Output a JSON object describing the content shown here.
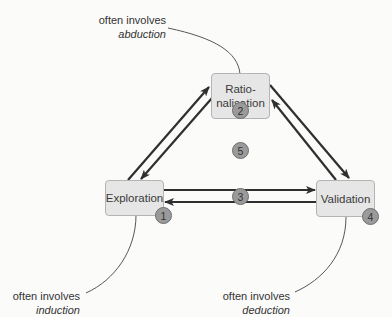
{
  "diagram": {
    "nodes": [
      {
        "id": "rationalisation",
        "label": "Ratio-\nnalisation",
        "badge": "2"
      },
      {
        "id": "exploration",
        "label": "Exploration",
        "badge": "1"
      },
      {
        "id": "validation",
        "label": "Validation",
        "badge": "4"
      }
    ],
    "center_badges": {
      "horizontal_link": "3",
      "center": "5"
    },
    "annotations": {
      "abduction": {
        "line1": "often involves",
        "line2": "abduction"
      },
      "induction": {
        "line1": "often involves",
        "line2": "induction"
      },
      "deduction": {
        "line1": "often involves",
        "line2": "deduction"
      }
    },
    "edges": [
      {
        "from": "exploration",
        "to": "rationalisation"
      },
      {
        "from": "rationalisation",
        "to": "exploration"
      },
      {
        "from": "rationalisation",
        "to": "validation"
      },
      {
        "from": "validation",
        "to": "rationalisation"
      },
      {
        "from": "exploration",
        "to": "validation"
      },
      {
        "from": "validation",
        "to": "exploration"
      }
    ],
    "colors": {
      "node_fill": "#e6e6e6",
      "badge_fill": "#9a9a9a",
      "arrow": "#2f2f2f"
    }
  }
}
